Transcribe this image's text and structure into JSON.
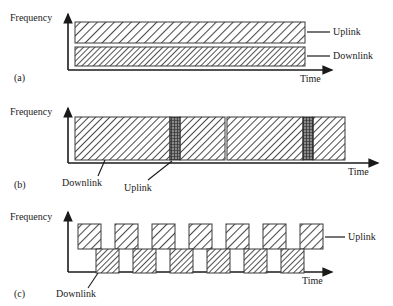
{
  "figure": {
    "axis": {
      "y_label": "Frequency",
      "x_label": "Time"
    },
    "legend_terms": {
      "uplink": "Uplink",
      "downlink": "Downlink"
    },
    "panels": [
      {
        "tag": "(a)",
        "scheme": "frequency-division-duplex",
        "y_label": "Frequency",
        "x_label": "Time",
        "bands": [
          {
            "name": "Uplink",
            "label": "Uplink",
            "row": "upper",
            "hatch": "diagonal-sparse"
          },
          {
            "name": "Downlink",
            "label": "Downlink",
            "row": "lower",
            "hatch": "diagonal-dense"
          }
        ]
      },
      {
        "tag": "(b)",
        "scheme": "time-division-duplex-asymmetric",
        "y_label": "Frequency",
        "x_label": "Time",
        "downlink_label": "Downlink",
        "uplink_label": "Uplink",
        "segments": [
          {
            "type": "downlink",
            "x": 75,
            "width": 95
          },
          {
            "type": "uplink",
            "x": 170,
            "width": 10
          },
          {
            "type": "downlink",
            "x": 180,
            "width": 45
          },
          {
            "type": "downlink",
            "x": 227,
            "width": 76
          },
          {
            "type": "uplink",
            "x": 303,
            "width": 10
          },
          {
            "type": "downlink",
            "x": 313,
            "width": 32
          }
        ]
      },
      {
        "tag": "(c)",
        "scheme": "time-division-duplex-alternating",
        "y_label": "Frequency",
        "x_label": "Time",
        "uplink_label": "Uplink",
        "downlink_label": "Downlink",
        "uplink_blocks_count": 7,
        "downlink_blocks_count": 6,
        "block_width": 23,
        "block_height": 25,
        "block_pitch": 37,
        "uplink_start_x": 78,
        "downlink_start_x": 96
      }
    ]
  }
}
